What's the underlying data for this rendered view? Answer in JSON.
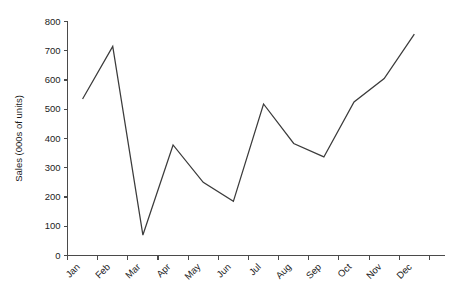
{
  "chart_data": {
    "type": "line",
    "title": "",
    "xlabel": "",
    "ylabel": "Sales (000s of units)",
    "categories": [
      "Jan",
      "Feb",
      "Mar",
      "Apr",
      "May",
      "Jun",
      "Jul",
      "Aug",
      "Sep",
      "Oct",
      "Nov",
      "Dec"
    ],
    "values": [
      535,
      715,
      70,
      378,
      250,
      185,
      518,
      383,
      337,
      525,
      605,
      757
    ],
    "series": [
      {
        "name": "Sales",
        "values": [
          535,
          715,
          70,
          378,
          250,
          185,
          518,
          383,
          337,
          525,
          605,
          757
        ]
      }
    ],
    "ylim": [
      0,
      800
    ],
    "ytick_labels": [
      "0",
      "100",
      "200",
      "300",
      "400",
      "500",
      "600",
      "700",
      "800"
    ],
    "ytick_values": [
      0,
      100,
      200,
      300,
      400,
      500,
      600,
      700,
      800
    ],
    "grid": false,
    "legend": false,
    "legend_position": "none",
    "line_color": "#3b3b3b",
    "axis_color": "#4a4a4a",
    "background_color": "#ffffff",
    "xtick_label_rotation": 45
  }
}
